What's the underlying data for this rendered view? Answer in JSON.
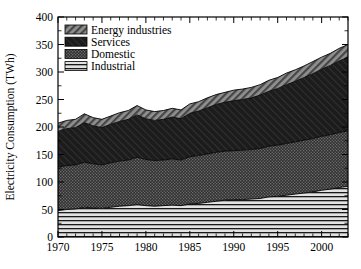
{
  "chart_data": {
    "type": "area",
    "title": "",
    "xlabel": "",
    "ylabel": "Electricity Consumption (TWh)",
    "xlim": [
      1970,
      2003
    ],
    "ylim": [
      0,
      400
    ],
    "ytick_step": 50,
    "xtick_step": 5,
    "minor_xtick_step": 1,
    "grid": false,
    "stacked": true,
    "legend_position": "top-left",
    "yticks": [
      "0",
      "50",
      "100",
      "150",
      "200",
      "250",
      "300",
      "350",
      "400"
    ],
    "xticks": [
      "1970",
      "1975",
      "1980",
      "1985",
      "1990",
      "1995",
      "2000"
    ],
    "x": [
      1970,
      1971,
      1972,
      1973,
      1974,
      1975,
      1976,
      1977,
      1978,
      1979,
      1980,
      1981,
      1982,
      1983,
      1984,
      1985,
      1986,
      1987,
      1988,
      1989,
      1990,
      1991,
      1992,
      1993,
      1994,
      1995,
      1996,
      1997,
      1998,
      1999,
      2000,
      2001,
      2002,
      2003
    ],
    "series": [
      {
        "name": "Industrial",
        "pattern": "horizontal-lines",
        "color": "#d8d8d8",
        "order": 4,
        "values": [
          48,
          50,
          51,
          54,
          53,
          52,
          54,
          56,
          57,
          59,
          57,
          56,
          57,
          58,
          57,
          60,
          61,
          63,
          65,
          67,
          68,
          68,
          69,
          70,
          73,
          74,
          76,
          78,
          80,
          82,
          85,
          87,
          90,
          92
        ]
      },
      {
        "name": "Domestic",
        "pattern": "dense-crosshatch",
        "color": "#3a3a3a",
        "order": 3,
        "values": [
          79,
          80,
          80,
          82,
          80,
          79,
          81,
          82,
          83,
          86,
          84,
          83,
          83,
          84,
          83,
          86,
          87,
          88,
          89,
          89,
          89,
          90,
          90,
          91,
          92,
          93,
          94,
          95,
          96,
          97,
          98,
          99,
          100,
          101
        ]
      },
      {
        "name": "Services",
        "pattern": "solid-dark",
        "color": "#1f1f1f",
        "order": 2,
        "values": [
          65,
          67,
          68,
          72,
          69,
          68,
          70,
          72,
          74,
          77,
          74,
          73,
          74,
          76,
          75,
          79,
          81,
          84,
          87,
          89,
          91,
          92,
          94,
          97,
          100,
          103,
          107,
          110,
          114,
          118,
          122,
          126,
          130,
          134
        ]
      },
      {
        "name": "Energy industries",
        "pattern": "diagonal-hatch",
        "color": "#9a9a9a",
        "order": 1,
        "values": [
          15,
          15,
          15,
          16,
          15,
          15,
          15,
          16,
          16,
          17,
          16,
          16,
          16,
          16,
          16,
          17,
          17,
          18,
          18,
          18,
          19,
          19,
          19,
          19,
          20,
          20,
          21,
          21,
          21,
          22,
          22,
          22,
          23,
          23
        ]
      }
    ],
    "totals": [
      207,
      212,
      214,
      224,
      217,
      214,
      220,
      226,
      230,
      239,
      231,
      228,
      230,
      234,
      231,
      242,
      246,
      253,
      259,
      263,
      267,
      269,
      272,
      277,
      285,
      290,
      298,
      304,
      311,
      319,
      327,
      334,
      343,
      350
    ],
    "legend_entries": [
      {
        "label": "Energy industries",
        "pattern": "diagonal-hatch"
      },
      {
        "label": "Services",
        "pattern": "solid-dark"
      },
      {
        "label": "Domestic",
        "pattern": "dense-crosshatch"
      },
      {
        "label": "Industrial",
        "pattern": "horizontal-lines"
      }
    ]
  }
}
